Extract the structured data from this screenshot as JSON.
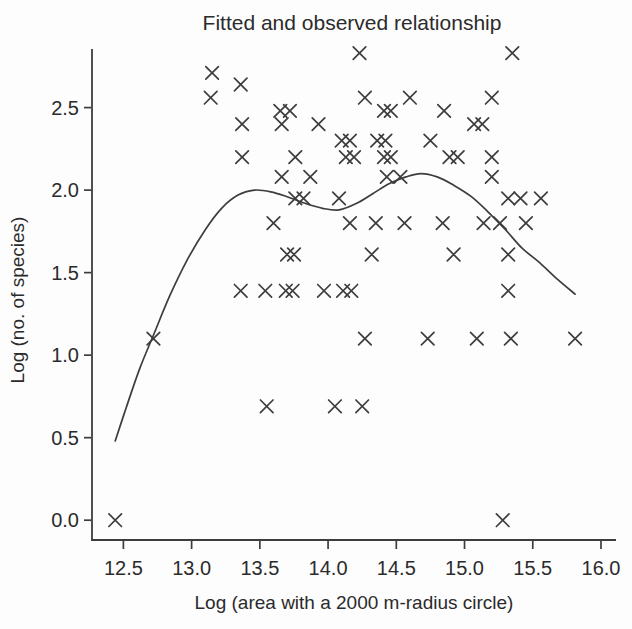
{
  "page": {
    "background": "#fdfdfd",
    "ink": "#3d3d3d",
    "text": "#2b2b2b"
  },
  "chart_data": {
    "type": "scatter",
    "title": "Fitted and observed relationship",
    "xlabel": "Log (area with a 2000 m-radius circle)",
    "ylabel": "Log (no. of species)",
    "xlim": [
      12.27,
      16.11
    ],
    "ylim": [
      -0.12,
      2.855
    ],
    "x_ticks": [
      12.5,
      13.0,
      13.5,
      14.0,
      14.5,
      15.0,
      15.5,
      16.0
    ],
    "x_tick_labels": [
      "12.5",
      "13.0",
      "13.5",
      "14.0",
      "14.5",
      "15.0",
      "15.5",
      "16.0"
    ],
    "y_ticks": [
      0.0,
      0.5,
      1.0,
      1.5,
      2.0,
      2.5
    ],
    "y_tick_labels": [
      "0.0",
      "0.5",
      "1.0",
      "1.5",
      "2.0",
      "2.5"
    ],
    "grid": false,
    "legend_position": "none",
    "series": [
      {
        "name": "observed",
        "type": "scatter",
        "marker": "x",
        "points": [
          [
            14.23,
            2.83
          ],
          [
            15.35,
            2.83
          ],
          [
            13.15,
            2.71
          ],
          [
            13.36,
            2.64
          ],
          [
            13.14,
            2.56
          ],
          [
            14.27,
            2.56
          ],
          [
            14.6,
            2.56
          ],
          [
            15.2,
            2.56
          ],
          [
            13.65,
            2.48
          ],
          [
            13.72,
            2.48
          ],
          [
            14.41,
            2.48
          ],
          [
            14.46,
            2.48
          ],
          [
            14.85,
            2.48
          ],
          [
            13.37,
            2.4
          ],
          [
            13.66,
            2.4
          ],
          [
            13.93,
            2.4
          ],
          [
            15.07,
            2.4
          ],
          [
            15.13,
            2.4
          ],
          [
            14.1,
            2.3
          ],
          [
            14.16,
            2.3
          ],
          [
            14.36,
            2.3
          ],
          [
            14.42,
            2.3
          ],
          [
            14.75,
            2.3
          ],
          [
            13.37,
            2.2
          ],
          [
            13.76,
            2.2
          ],
          [
            14.13,
            2.2
          ],
          [
            14.19,
            2.2
          ],
          [
            14.41,
            2.2
          ],
          [
            14.46,
            2.2
          ],
          [
            14.89,
            2.2
          ],
          [
            14.95,
            2.2
          ],
          [
            15.2,
            2.2
          ],
          [
            13.66,
            2.08
          ],
          [
            13.87,
            2.08
          ],
          [
            14.43,
            2.08
          ],
          [
            14.53,
            2.08
          ],
          [
            15.2,
            2.08
          ],
          [
            13.76,
            1.95
          ],
          [
            13.82,
            1.95
          ],
          [
            14.08,
            1.95
          ],
          [
            15.32,
            1.95
          ],
          [
            15.41,
            1.95
          ],
          [
            15.56,
            1.95
          ],
          [
            13.6,
            1.8
          ],
          [
            14.16,
            1.8
          ],
          [
            14.35,
            1.8
          ],
          [
            14.56,
            1.8
          ],
          [
            14.84,
            1.8
          ],
          [
            15.14,
            1.8
          ],
          [
            15.26,
            1.8
          ],
          [
            15.45,
            1.8
          ],
          [
            13.7,
            1.61
          ],
          [
            13.75,
            1.61
          ],
          [
            14.32,
            1.61
          ],
          [
            14.92,
            1.61
          ],
          [
            15.32,
            1.61
          ],
          [
            13.36,
            1.39
          ],
          [
            13.54,
            1.39
          ],
          [
            13.69,
            1.39
          ],
          [
            13.74,
            1.39
          ],
          [
            13.97,
            1.39
          ],
          [
            14.11,
            1.39
          ],
          [
            14.17,
            1.39
          ],
          [
            15.32,
            1.39
          ],
          [
            12.72,
            1.1
          ],
          [
            14.27,
            1.1
          ],
          [
            14.73,
            1.1
          ],
          [
            15.09,
            1.1
          ],
          [
            15.34,
            1.1
          ],
          [
            15.81,
            1.1
          ],
          [
            13.55,
            0.69
          ],
          [
            14.05,
            0.69
          ],
          [
            14.25,
            0.69
          ],
          [
            12.44,
            0.0
          ],
          [
            15.28,
            0.0
          ]
        ]
      },
      {
        "name": "fitted",
        "type": "line",
        "points": [
          [
            12.44,
            0.48
          ],
          [
            12.52,
            0.68
          ],
          [
            12.62,
            0.92
          ],
          [
            12.72,
            1.12
          ],
          [
            12.84,
            1.36
          ],
          [
            12.97,
            1.58
          ],
          [
            13.1,
            1.76
          ],
          [
            13.22,
            1.89
          ],
          [
            13.34,
            1.97
          ],
          [
            13.46,
            2.0
          ],
          [
            13.58,
            1.99
          ],
          [
            13.7,
            1.96
          ],
          [
            13.83,
            1.92
          ],
          [
            13.96,
            1.89
          ],
          [
            14.08,
            1.88
          ],
          [
            14.21,
            1.92
          ],
          [
            14.33,
            1.98
          ],
          [
            14.45,
            2.04
          ],
          [
            14.57,
            2.08
          ],
          [
            14.68,
            2.1
          ],
          [
            14.8,
            2.08
          ],
          [
            14.92,
            2.03
          ],
          [
            15.05,
            1.96
          ],
          [
            15.17,
            1.87
          ],
          [
            15.3,
            1.76
          ],
          [
            15.42,
            1.65
          ],
          [
            15.55,
            1.56
          ],
          [
            15.68,
            1.46
          ],
          [
            15.81,
            1.37
          ]
        ]
      }
    ]
  }
}
